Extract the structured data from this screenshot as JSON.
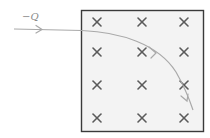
{
  "diagram": {
    "charge_label": "−Q",
    "field_symbol": "×",
    "field_direction": "into-page",
    "field_grid": {
      "rows": 4,
      "cols": 3
    },
    "colors": {
      "box_fill": "#f3f3f3",
      "box_border": "#3a3a3a",
      "field_mark": "#5a5a5a",
      "path": "#a9a9a9",
      "label": "#8a8a8a"
    }
  }
}
